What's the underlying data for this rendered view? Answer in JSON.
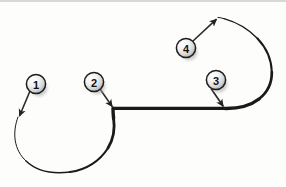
{
  "figure": {
    "background_color": "#fdfdfc",
    "stroke_color": "#1a1a1a",
    "top_border_color": "#d8d8d6",
    "width": 286,
    "height": 187
  },
  "path": {
    "description": "continuous tapered curve: small left loop, straight middle segment, large right loop",
    "segments": [
      {
        "name": "left-loop-arc",
        "type": "arc",
        "start": [
          18,
          117
        ],
        "end": [
          113,
          108
        ],
        "center": [
          70,
          129
        ],
        "radius": 55,
        "start_width": 0.8,
        "end_width": 3.4
      },
      {
        "name": "middle-straight-segment",
        "type": "line",
        "start": [
          113,
          108
        ],
        "end": [
          224,
          108
        ],
        "width": 3.4
      },
      {
        "name": "right-loop-arc",
        "type": "arc",
        "start": [
          224,
          108
        ],
        "end": [
          218,
          17
        ],
        "center": [
          224,
          62
        ],
        "radius": 46,
        "start_width": 3.4,
        "end_width": 0.8
      }
    ]
  },
  "markers": [
    {
      "id": "1",
      "label": "1",
      "circle": {
        "cx": 36,
        "cy": 84,
        "r": 10
      },
      "leader": {
        "from": [
          29,
          92
        ],
        "to": [
          19,
          117
        ]
      },
      "target": "left-loop-start"
    },
    {
      "id": "2",
      "label": "2",
      "circle": {
        "cx": 94,
        "cy": 82,
        "r": 10
      },
      "leader": {
        "from": [
          100,
          90
        ],
        "to": [
          112,
          107
        ]
      },
      "target": "left-loop-to-straight-junction"
    },
    {
      "id": "3",
      "label": "3",
      "circle": {
        "cx": 216,
        "cy": 80,
        "r": 10
      },
      "leader": {
        "from": [
          211,
          89
        ],
        "to": [
          223,
          106
        ]
      },
      "target": "straight-to-right-loop-junction"
    },
    {
      "id": "4",
      "label": "4",
      "circle": {
        "cx": 186,
        "cy": 48,
        "r": 10
      },
      "leader": {
        "from": [
          193,
          41
        ],
        "to": [
          216,
          19
        ]
      },
      "target": "right-loop-end"
    }
  ],
  "colors": {
    "marker_fill_light": "#ffffff",
    "marker_fill_mid": "#e2e2e2",
    "marker_fill_dark": "#a8a8a8",
    "marker_ring": "#1c1c1c",
    "marker_shadow": "#9a9a9a",
    "leader_line": "#2a2a2a"
  }
}
